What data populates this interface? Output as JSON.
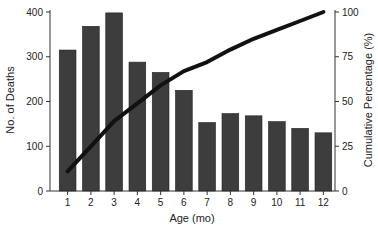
{
  "chart_data": {
    "type": "bar",
    "title": "",
    "xlabel": "Age (mo)",
    "ylabel": "No. of Deaths",
    "y2label": "Cumulative Percentage (%)",
    "categories": [
      "1",
      "2",
      "3",
      "4",
      "5",
      "6",
      "7",
      "8",
      "9",
      "10",
      "11",
      "12"
    ],
    "series": [
      {
        "name": "No. of Deaths",
        "type": "bar",
        "axis": "left",
        "values": [
          315,
          368,
          398,
          288,
          265,
          225,
          153,
          173,
          168,
          155,
          140,
          130
        ]
      },
      {
        "name": "Cumulative Percentage",
        "type": "line",
        "axis": "right",
        "values": [
          11,
          25,
          39,
          49,
          59,
          67,
          72,
          79,
          85,
          90,
          95,
          100
        ]
      }
    ],
    "ylim": [
      0,
      400
    ],
    "yticks": [
      "0",
      "100",
      "200",
      "300",
      "400"
    ],
    "y2lim": [
      0,
      100
    ],
    "y2ticks": [
      "0",
      "25",
      "50",
      "75",
      "100"
    ],
    "grid": false,
    "legend": "none"
  }
}
